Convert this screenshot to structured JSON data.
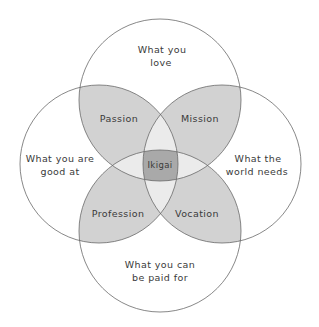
{
  "diagram": {
    "title": "Ikigai",
    "colors": {
      "background": "#ffffff",
      "outline": "#6a6a6a",
      "petal_fill": "#d2d2d2",
      "triple_fill": "#ebebeb",
      "center_fill": "#a9a9a9",
      "text": "#3a3a3a"
    },
    "circles": {
      "top": {
        "line1": "What you",
        "line2": "love"
      },
      "left": {
        "line1": "What you are",
        "line2": "good at"
      },
      "right": {
        "line1": "What the",
        "line2": "world needs"
      },
      "bottom": {
        "line1": "What you can",
        "line2": "be paid for"
      }
    },
    "overlaps": {
      "top_left": "Passion",
      "top_right": "Mission",
      "bottom_left": "Profession",
      "bottom_right": "Vocation",
      "center": "Ikigai"
    }
  }
}
